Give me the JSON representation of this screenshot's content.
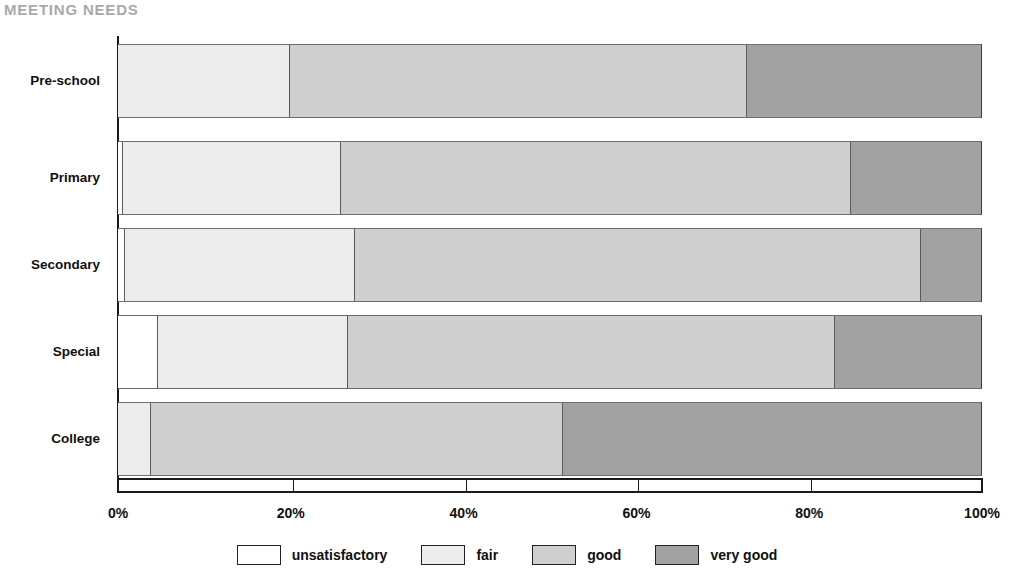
{
  "chart_data": {
    "type": "bar",
    "subtype": "stacked-horizontal-100pct",
    "title": "MEETING NEEDS",
    "xlabel": "",
    "ylabel": "",
    "xlim": [
      0,
      100
    ],
    "grid": false,
    "legend_position": "bottom-center",
    "categories": [
      "Pre-school",
      "Primary",
      "Secondary",
      "Special",
      "College"
    ],
    "x_tick_labels": [
      "0%",
      "20%",
      "40%",
      "60%",
      "80%",
      "100%"
    ],
    "x_tick_values": [
      0,
      20,
      40,
      60,
      80,
      100
    ],
    "series": [
      {
        "name": "unsatisfactory",
        "color": "#ffffff",
        "values": [
          0.0,
          0.5,
          0.7,
          4.5,
          0.0
        ]
      },
      {
        "name": "fair",
        "color": "#ededed",
        "values": [
          19.8,
          25.2,
          26.7,
          22.0,
          3.7
        ]
      },
      {
        "name": "good",
        "color": "#cfcfcf",
        "values": [
          53.0,
          59.1,
          65.5,
          56.5,
          47.8
        ]
      },
      {
        "name": "very good",
        "color": "#a2a2a2",
        "values": [
          27.2,
          15.2,
          7.1,
          17.0,
          48.5
        ]
      }
    ]
  },
  "legend": {
    "items": [
      {
        "label": "unsatisfactory",
        "color": "#ffffff"
      },
      {
        "label": "fair",
        "color": "#ededed"
      },
      {
        "label": "good",
        "color": "#cfcfcf"
      },
      {
        "label": "very good",
        "color": "#a2a2a2"
      }
    ]
  },
  "colors": {
    "title": "#a9a9a9",
    "axis": "#1a1a1a",
    "segment_border": "#5a5a5a",
    "text": "#101010"
  }
}
